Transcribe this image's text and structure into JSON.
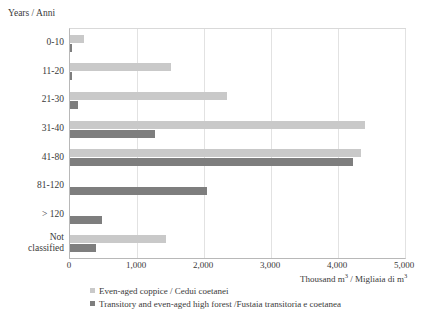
{
  "chart_data": {
    "type": "bar",
    "orientation": "horizontal",
    "title": "",
    "ylabel": "Years / Anni",
    "xlabel": "Thousand m³ / Migliaia di m³",
    "categories": [
      "0-10",
      "11-20",
      "21-30",
      "31-40",
      "41-80",
      "81-120",
      "> 120",
      "Not classified"
    ],
    "xlim": [
      0,
      5000
    ],
    "xticks": [
      0,
      1000,
      2000,
      3000,
      4000,
      5000
    ],
    "xtick_labels": [
      "0",
      "1,000",
      "2,000",
      "3,000",
      "4,000",
      "5,000"
    ],
    "grid": true,
    "grid_axis": "x",
    "legend_position": "bottom",
    "series": [
      {
        "name": "Even-aged coppice / Cedui coetanei",
        "color": "#c9c9c9",
        "values": [
          215,
          1510,
          2340,
          4400,
          4345,
          0,
          0,
          1435
        ]
      },
      {
        "name": "Transitory and even-aged high forest /Fustaia transitoria e coetanea",
        "color": "#7e7e7e",
        "values": [
          30,
          35,
          115,
          1270,
          4230,
          2050,
          480,
          390
        ]
      }
    ]
  },
  "axis": {
    "y_title": "Years / Anni",
    "x_title_prefix": "Thousand m",
    "x_title_mid": " / Migliaia di m",
    "x_title_sup": "3"
  },
  "legend": {
    "items": [
      {
        "label": "Even-aged coppice / Cedui coetanei",
        "swatch": "light"
      },
      {
        "label": "Transitory and even-aged high forest /Fustaia transitoria e coetanea",
        "swatch": "dark"
      }
    ]
  }
}
